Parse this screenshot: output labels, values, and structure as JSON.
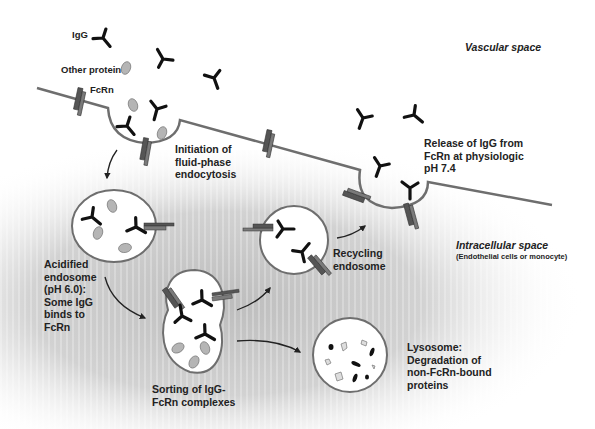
{
  "diagram": {
    "regions": {
      "vascular_space": "Vascular space",
      "intracellular_space": "Intracellular space",
      "intracellular_note": "(Endothelial cells or monocyte)"
    },
    "legend": {
      "igg": "IgG",
      "other_protein": "Other protein",
      "fcrn": "FcRn"
    },
    "steps": {
      "initiation": "Initiation of\nfluid-phase\nendocytosis",
      "acidified": "Acidified\nendosome\n(pH 6.0):\nSome IgG\nbinds to\nFcRn",
      "sorting": "Sorting of IgG-\nFcRn complexes",
      "recycling": "Recycling\nendosome",
      "release": "Release of IgG from\nFcRn at physiologic\npH 7.4",
      "lysosome": "Lysosome:\nDegradation of\nnon-FcRn-bound\nproteins"
    },
    "colors": {
      "membrane": "#6e6e6e",
      "igg": "#111111",
      "fcrn_dark": "#555555",
      "fcrn_light": "#7a7a7a",
      "protein": "#b5b5b5",
      "cytoplasm_shade": "#c8c8c8"
    }
  }
}
